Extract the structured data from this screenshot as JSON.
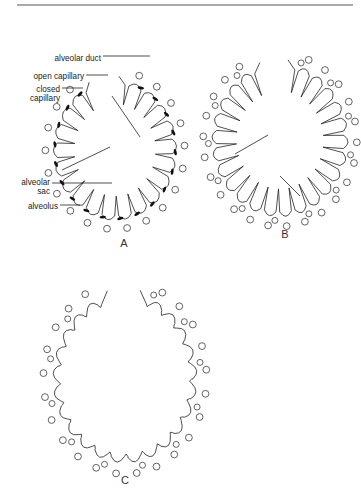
{
  "figure": {
    "top_rule": {
      "x1": 17,
      "x2": 353,
      "y": 5,
      "color": "#555555"
    },
    "ink_color": "#222222",
    "panels": [
      {
        "id": "A",
        "label": "A",
        "label_pos": [
          124,
          247
        ],
        "center": [
          115,
          150
        ],
        "rx": 58,
        "ry": 66,
        "start_deg": -78,
        "end_deg": 238,
        "alveoli": 19,
        "septum_depth": 0.3,
        "capillary_style": "open-and-closed",
        "long_septa": [
          [
            62,
            170,
            110,
            147
          ],
          [
            112,
            96,
            140,
            137
          ]
        ]
      },
      {
        "id": "B",
        "label": "B",
        "label_pos": [
          285,
          238
        ],
        "center": [
          280,
          140
        ],
        "rx": 64,
        "ry": 72,
        "start_deg": -75,
        "end_deg": 245,
        "alveoli": 23,
        "septum_depth": 0.32,
        "capillary_style": "open",
        "long_septa": [
          [
            235,
            154,
            268,
            135
          ],
          [
            280,
            176,
            300,
            196
          ]
        ]
      },
      {
        "id": "C",
        "label": "C",
        "label_pos": [
          125,
          484
        ],
        "center": [
          125,
          378
        ],
        "rx": 68,
        "ry": 80,
        "start_deg": -70,
        "end_deg": 248,
        "alveoli": 22,
        "septum_depth": 0.05,
        "capillary_style": "open",
        "long_septa": []
      }
    ],
    "annotations": [
      {
        "text_lines": [
          "alveolar duct"
        ],
        "anchor": [
          101,
          58
        ],
        "line": [
          103,
          56,
          150,
          56
        ]
      },
      {
        "text_lines": [
          "open capillary"
        ],
        "anchor": [
          84,
          76
        ],
        "line": [
          86,
          75,
          108,
          75
        ]
      },
      {
        "text_lines": [
          "closed",
          "capillary"
        ],
        "anchor": [
          60,
          89
        ],
        "line": [
          62,
          88,
          83,
          88
        ]
      },
      {
        "text_lines": [
          "alveolar",
          "sac"
        ],
        "anchor": [
          50,
          182
        ],
        "line": [
          52,
          183,
          112,
          183
        ]
      },
      {
        "text_lines": [
          "alveolus"
        ],
        "anchor": [
          58,
          206
        ],
        "line": [
          60,
          205,
          80,
          205
        ]
      }
    ]
  }
}
